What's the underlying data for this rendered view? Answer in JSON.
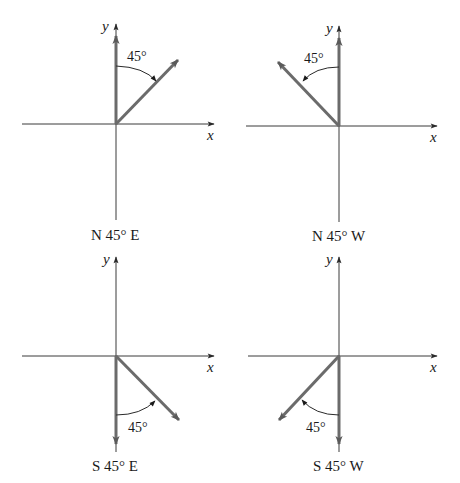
{
  "figure": {
    "panels": [
      {
        "id": "ne",
        "caption": "N 45° E",
        "angle_label": "45°",
        "x_label": "x",
        "y_label": "y",
        "reference_axis": "north (+y)",
        "vector_direction": "northeast",
        "angle_degrees": 45
      },
      {
        "id": "nw",
        "caption": "N 45° W",
        "angle_label": "45°",
        "x_label": "x",
        "y_label": "y",
        "reference_axis": "north (+y)",
        "vector_direction": "northwest",
        "angle_degrees": 45
      },
      {
        "id": "se",
        "caption": "S 45° E",
        "angle_label": "45°",
        "x_label": "x",
        "y_label": "y",
        "reference_axis": "south (-y)",
        "vector_direction": "southeast",
        "angle_degrees": 45
      },
      {
        "id": "sw",
        "caption": "S 45° W",
        "angle_label": "45°",
        "x_label": "x",
        "y_label": "y",
        "reference_axis": "south (-y)",
        "vector_direction": "southwest",
        "angle_degrees": 45
      }
    ],
    "colors": {
      "axis": "#3a3a3a",
      "vector": "#6b6b6b",
      "text": "#1a1a1a",
      "background": "#ffffff"
    }
  }
}
